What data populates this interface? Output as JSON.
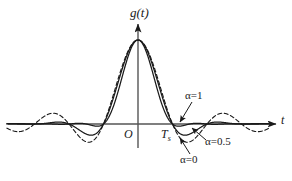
{
  "figure": {
    "title": "",
    "background": "#ffffff",
    "line_color": "#1a1a1a",
    "axis_color": "#555555"
  },
  "axes": {
    "y_label": "g(t)",
    "x_label": "t",
    "origin_label": "O",
    "symbol_tick_label": "T",
    "symbol_tick_sub": "s"
  },
  "annotations": [
    {
      "name": "alpha-1",
      "alpha_symbol": "α",
      "text": "=1",
      "full": "α=1"
    },
    {
      "name": "alpha-05",
      "alpha_symbol": "α",
      "text": "=0.5",
      "full": "α=0.5"
    },
    {
      "name": "alpha-0",
      "alpha_symbol": "α",
      "text": "=0",
      "full": "α=0"
    }
  ],
  "chart_data": {
    "type": "line",
    "xlabel": "t",
    "ylabel": "g(t)",
    "xlim": [
      -3.8,
      3.8
    ],
    "ylim": [
      -0.32,
      1.08
    ],
    "grid": false,
    "legend_position": "inline-annotations",
    "x_unit": "Ts",
    "x_tick_labels": [
      "O",
      "Ts"
    ],
    "x_tick_values": [
      0,
      1
    ],
    "series": [
      {
        "name": "α=0",
        "roll_off": 0,
        "style": "dashed",
        "color": "#1a1a1a",
        "description": "sinc(t/Ts) — largest sidelobes, slow decay"
      },
      {
        "name": "α=0.5",
        "roll_off": 0.5,
        "style": "solid",
        "color": "#1a1a1a",
        "description": "raised cosine, moderate sidelobes"
      },
      {
        "name": "α=1",
        "roll_off": 1,
        "style": "solid",
        "color": "#1a1a1a",
        "description": "raised cosine, smallest sidelobes, fastest decay"
      }
    ],
    "key_points": [
      {
        "t": 0,
        "g": 1.0,
        "note": "peak at origin, all curves"
      },
      {
        "t": 1,
        "g": 0.0,
        "note": "first zero crossing at Ts, all curves"
      },
      {
        "t": 2,
        "g": 0.0,
        "note": "zero crossing at 2Ts, all curves"
      },
      {
        "t": 3,
        "g": 0.0,
        "note": "zero crossing at 3Ts, all curves"
      },
      {
        "t": 1.5,
        "g": -0.212,
        "note": "α=0 first negative sidelobe"
      },
      {
        "t": 2.5,
        "g": 0.127,
        "note": "α=0 positive sidelobe"
      },
      {
        "t": 3.5,
        "g": -0.091,
        "note": "α=0 sidelobe"
      }
    ]
  }
}
